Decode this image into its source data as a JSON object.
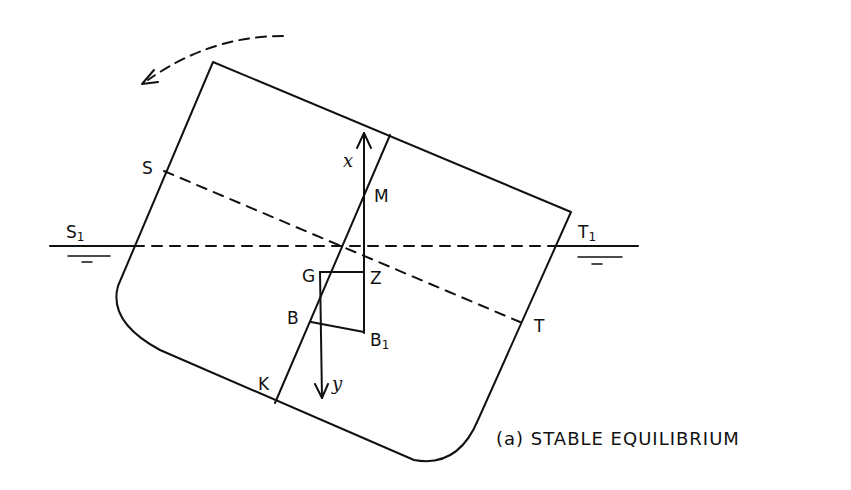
{
  "diagram": {
    "caption": "(a) STABLE EQUILIBRIUM",
    "points": {
      "S": "S",
      "S1": "S",
      "S1_sub": "1",
      "T": "T",
      "T1": "T",
      "T1_sub": "1",
      "M": "M",
      "G": "G",
      "Z": "Z",
      "B": "B",
      "B1": "B",
      "B1_sub": "1",
      "K": "K"
    },
    "axes": {
      "x": "x",
      "y": "y"
    },
    "colors": {
      "ink": "#111111",
      "background": "#ffffff"
    }
  }
}
